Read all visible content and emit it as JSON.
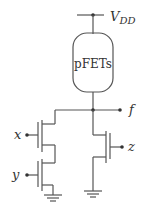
{
  "diagram": {
    "type": "CMOS logic gate schematic",
    "supply": {
      "label": "V",
      "subscript": "DD"
    },
    "pull_up": {
      "label": "pFETs"
    },
    "output": {
      "label": "f"
    },
    "inputs": [
      {
        "label": "x"
      },
      {
        "label": "y"
      },
      {
        "label": "z"
      }
    ],
    "colors": {
      "wire": "#555555",
      "text": "#333333",
      "background": "#ffffff"
    }
  }
}
